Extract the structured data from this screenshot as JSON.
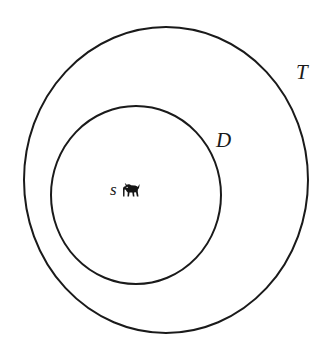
{
  "diagram": {
    "type": "euler-venn-nested-sets",
    "background_color": "#ffffff",
    "stroke_color": "#1a1a1a",
    "stroke_width": 2,
    "outer_set": {
      "label": "T",
      "name": "outer-set-T",
      "center_x": 166,
      "center_y": 180,
      "radius_x": 142,
      "radius_y": 153,
      "label_x": 296,
      "label_y": 62
    },
    "inner_set": {
      "label": "D",
      "name": "inner-set-D",
      "center_x": 136,
      "center_y": 195,
      "radius_x": 85,
      "radius_y": 89,
      "label_x": 216,
      "label_y": 130
    },
    "element": {
      "label": "s",
      "icon": "dog-icon",
      "x": 110,
      "y": 181
    }
  }
}
